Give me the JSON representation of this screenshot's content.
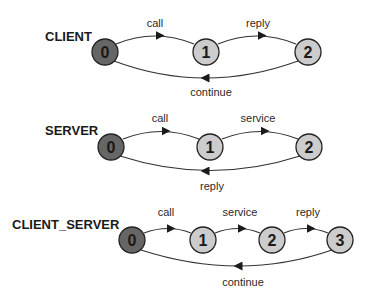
{
  "diagrams": [
    {
      "title": "CLIENT",
      "initial_color": "#666666",
      "state_color": "#cccccc",
      "states": [
        "0",
        "1",
        "2"
      ],
      "transitions": [
        {
          "from": "0",
          "to": "1",
          "label": "call"
        },
        {
          "from": "1",
          "to": "2",
          "label": "reply"
        },
        {
          "from": "2",
          "to": "0",
          "label": "continue"
        }
      ]
    },
    {
      "title": "SERVER",
      "initial_color": "#666666",
      "state_color": "#cccccc",
      "states": [
        "0",
        "1",
        "2"
      ],
      "transitions": [
        {
          "from": "0",
          "to": "1",
          "label": "call"
        },
        {
          "from": "1",
          "to": "2",
          "label": "service"
        },
        {
          "from": "2",
          "to": "0",
          "label": "reply"
        }
      ]
    },
    {
      "title": "CLIENT_SERVER",
      "initial_color": "#666666",
      "state_color": "#cccccc",
      "states": [
        "0",
        "1",
        "2",
        "3"
      ],
      "transitions": [
        {
          "from": "0",
          "to": "1",
          "label": "call"
        },
        {
          "from": "1",
          "to": "2",
          "label": "service"
        },
        {
          "from": "2",
          "to": "3",
          "label": "reply"
        },
        {
          "from": "3",
          "to": "0",
          "label": "continue"
        }
      ]
    }
  ]
}
